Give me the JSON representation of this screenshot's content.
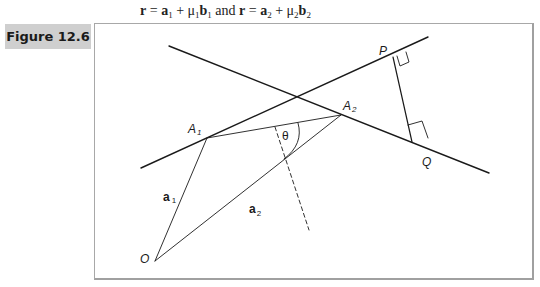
{
  "header": {
    "equation_parts": {
      "r1": "r",
      "eq1": " = ",
      "a1": "a",
      "a1_sub": "1",
      "plus1": " + μ",
      "mu1_sub": "1",
      "b1": "b",
      "b1_sub": "1",
      "and": " and ",
      "r2": "r",
      "eq2": " = ",
      "a2": "a",
      "a2_sub": "2",
      "plus2": " + μ",
      "mu2_sub": "2",
      "b2": "b",
      "b2_sub": "2"
    }
  },
  "figure": {
    "label": "Figure 12.6",
    "points": {
      "O": {
        "name": "O",
        "x": 155,
        "y": 261
      },
      "A1": {
        "name": "A",
        "sub": "1",
        "x": 207,
        "y": 138
      },
      "A2": {
        "name": "A",
        "sub": "2",
        "x": 341,
        "y": 115
      },
      "P": {
        "name": "P",
        "x": 393,
        "y": 57
      },
      "Q": {
        "name": "Q",
        "x": 412,
        "y": 142
      }
    },
    "vector_labels": {
      "a1": {
        "text": "a",
        "sub": "1"
      },
      "a2": {
        "text": "a",
        "sub": "2"
      }
    },
    "angle_label": "θ",
    "lines": {
      "line1": {
        "x1": 141,
        "y1": 168,
        "x2": 428,
        "y2": 37
      },
      "line2": {
        "x1": 169,
        "y1": 46,
        "x2": 489,
        "y2": 173
      }
    }
  }
}
